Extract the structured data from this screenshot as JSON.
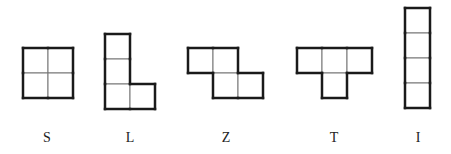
{
  "figure": {
    "cell_size": 25,
    "outline_color": "#1a1a1a",
    "grid_color": "#777777",
    "pieces": [
      {
        "id": "S",
        "label": "S",
        "origin": [
          23,
          48
        ],
        "cells": [
          [
            0,
            0
          ],
          [
            1,
            0
          ],
          [
            0,
            1
          ],
          [
            1,
            1
          ]
        ],
        "label_x": 47
      },
      {
        "id": "L",
        "label": "L",
        "origin": [
          105,
          34
        ],
        "cells": [
          [
            0,
            0
          ],
          [
            0,
            1
          ],
          [
            0,
            2
          ],
          [
            1,
            2
          ]
        ],
        "label_x": 130
      },
      {
        "id": "Z",
        "label": "Z",
        "origin": [
          188,
          48
        ],
        "cells": [
          [
            0,
            0
          ],
          [
            1,
            0
          ],
          [
            1,
            1
          ],
          [
            2,
            1
          ]
        ],
        "label_x": 226
      },
      {
        "id": "T",
        "label": "T",
        "origin": [
          297,
          48
        ],
        "cells": [
          [
            0,
            0
          ],
          [
            1,
            0
          ],
          [
            2,
            0
          ],
          [
            1,
            1
          ]
        ],
        "label_x": 334
      },
      {
        "id": "I",
        "label": "I",
        "origin": [
          405,
          8
        ],
        "cells": [
          [
            0,
            0
          ],
          [
            0,
            1
          ],
          [
            0,
            2
          ],
          [
            0,
            3
          ]
        ],
        "label_x": 418
      }
    ],
    "label_y": 131
  }
}
